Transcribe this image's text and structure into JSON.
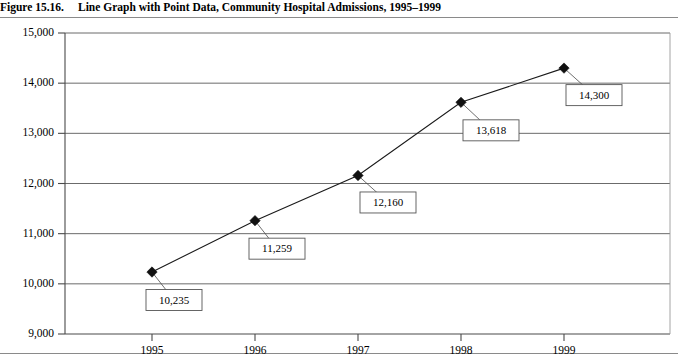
{
  "figure": {
    "number": "Figure 15.16.",
    "title": "Line Graph with Point Data, Community Hospital Admissions, 1995–1999"
  },
  "chart_data": {
    "type": "line",
    "title": "Line Graph with Point Data, Community Hospital Admissions, 1995–1999",
    "xlabel": "",
    "ylabel": "",
    "categories": [
      "1995",
      "1996",
      "1997",
      "1998",
      "1999"
    ],
    "values": [
      10235,
      11259,
      12160,
      13618,
      14300
    ],
    "point_labels": [
      "10,235",
      "11,259",
      "12,160",
      "13,618",
      "14,300"
    ],
    "ylim": [
      9000,
      15000
    ],
    "yticks": [
      9000,
      10000,
      11000,
      12000,
      13000,
      14000,
      15000
    ],
    "ytick_labels": [
      "9,000",
      "10,000",
      "11,000",
      "12,000",
      "13,000",
      "14,000",
      "15,000"
    ],
    "xticks": [
      "1995",
      "1996",
      "1997",
      "1998",
      "1999"
    ],
    "grid": true,
    "grid_axis": "y",
    "legend": false,
    "legend_position": "none",
    "marker": "diamond",
    "marker_color": "#101010",
    "line_color": "#1a1a1a",
    "callouts": true
  },
  "colors": {
    "line": "#1a1a1a",
    "marker": "#101010",
    "grid": "#5a5a5a",
    "axis": "#4a4a4a",
    "callout_border": "#555555",
    "background": "#ffffff",
    "rule": "#8a8a8a"
  }
}
